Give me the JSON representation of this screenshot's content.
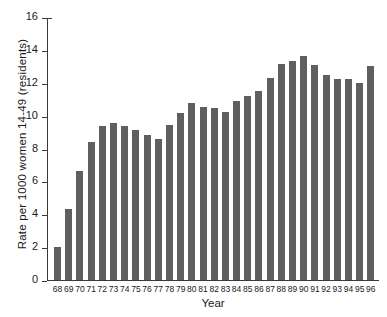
{
  "chart_data": {
    "type": "bar",
    "title": "",
    "xlabel": "Year",
    "ylabel": "Rate per 1000 women 14-49 (residents)",
    "categories": [
      "68",
      "69",
      "70",
      "71",
      "72",
      "73",
      "74",
      "75",
      "76",
      "77",
      "78",
      "79",
      "80",
      "81",
      "82",
      "83",
      "84",
      "85",
      "86",
      "87",
      "88",
      "89",
      "90",
      "91",
      "92",
      "93",
      "94",
      "95",
      "96"
    ],
    "values": [
      2.0,
      4.35,
      6.65,
      8.4,
      9.4,
      9.55,
      9.35,
      9.1,
      8.8,
      8.6,
      9.45,
      10.15,
      10.75,
      10.55,
      10.45,
      10.2,
      10.9,
      11.2,
      11.5,
      12.3,
      13.15,
      13.3,
      13.6,
      13.1,
      12.45,
      12.2,
      12.2,
      12.0,
      13.0
    ],
    "ylim": [
      0,
      16
    ],
    "ytick_values": [
      0,
      2,
      4,
      6,
      8,
      10,
      12,
      14,
      16
    ],
    "ytick_labels": [
      "0",
      "2",
      "4",
      "6",
      "8",
      "10",
      "12",
      "14",
      "16"
    ],
    "grid": false,
    "legend": null,
    "bar_color": "#5f5f5f",
    "axis_color": "#3a3a3a",
    "background": "#ffffff"
  }
}
